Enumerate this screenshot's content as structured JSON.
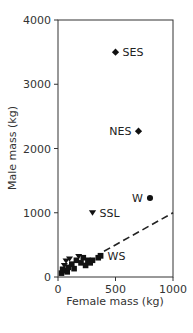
{
  "chart_data": {
    "type": "scatter",
    "title": "",
    "xlabel": "Female mass (kg)",
    "ylabel": "Male mass (kg)",
    "xlim": [
      0,
      1000
    ],
    "ylim": [
      0,
      4000
    ],
    "xticks": [
      0,
      500,
      1000
    ],
    "yticks": [
      0,
      1000,
      2000,
      3000,
      4000
    ],
    "grid": false,
    "legend": null,
    "labeled_points": [
      {
        "label": "SES",
        "x": 500,
        "y": 3500,
        "marker": "diamond"
      },
      {
        "label": "NES",
        "x": 700,
        "y": 2270,
        "marker": "diamond"
      },
      {
        "label": "W",
        "x": 800,
        "y": 1230,
        "marker": "circle"
      },
      {
        "label": "SSL",
        "x": 300,
        "y": 1000,
        "marker": "triangle-down"
      },
      {
        "label": "WS",
        "x": 370,
        "y": 330,
        "marker": "square"
      }
    ],
    "cluster_points": [
      {
        "x": 30,
        "y": 60,
        "marker": "square"
      },
      {
        "x": 40,
        "y": 120,
        "marker": "square"
      },
      {
        "x": 55,
        "y": 180,
        "marker": "triangle-down"
      },
      {
        "x": 60,
        "y": 100,
        "marker": "square"
      },
      {
        "x": 70,
        "y": 250,
        "marker": "triangle-down"
      },
      {
        "x": 80,
        "y": 80,
        "marker": "square"
      },
      {
        "x": 90,
        "y": 150,
        "marker": "square"
      },
      {
        "x": 100,
        "y": 280,
        "marker": "triangle-down"
      },
      {
        "x": 120,
        "y": 200,
        "marker": "square"
      },
      {
        "x": 140,
        "y": 130,
        "marker": "square"
      },
      {
        "x": 160,
        "y": 260,
        "marker": "square"
      },
      {
        "x": 180,
        "y": 320,
        "marker": "triangle-down"
      },
      {
        "x": 200,
        "y": 220,
        "marker": "square"
      },
      {
        "x": 220,
        "y": 300,
        "marker": "square"
      },
      {
        "x": 240,
        "y": 180,
        "marker": "square"
      },
      {
        "x": 260,
        "y": 260,
        "marker": "square"
      },
      {
        "x": 280,
        "y": 220,
        "marker": "square"
      },
      {
        "x": 300,
        "y": 260,
        "marker": "square"
      },
      {
        "x": 350,
        "y": 300,
        "marker": "square"
      }
    ],
    "reference_line": {
      "style": "dashed",
      "from": [
        0,
        0
      ],
      "to": [
        1000,
        1000
      ],
      "label": "1:1 line"
    }
  }
}
